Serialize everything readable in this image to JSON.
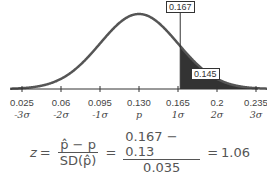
{
  "chart_data": {
    "type": "area",
    "title": "",
    "mean": 0.13,
    "sd": 0.035,
    "x_ticks": [
      0.025,
      0.06,
      0.095,
      0.13,
      0.165,
      0.2,
      0.235
    ],
    "x_tick_labels": [
      "0.025",
      "0.06",
      "0.095",
      "0.130",
      "0.165",
      "0.2",
      "0.235"
    ],
    "sigma_labels": [
      "-3σ",
      "-2σ",
      "-1σ",
      "p",
      "1σ",
      "2σ",
      "3σ"
    ],
    "observed_value": 0.167,
    "shaded_region": {
      "from": 0.167,
      "to": "inf",
      "area": 0.145
    },
    "annotations": [
      "0.167",
      "0.145"
    ],
    "xlabel": "",
    "ylabel": "",
    "grid": false
  },
  "labels": {
    "observed": "0.167",
    "tail_area": "0.145"
  },
  "formula": {
    "lhs": "z",
    "eq1": "=",
    "frac1_num": "p̂ − p",
    "frac1_den": "SD(p̂)",
    "eq2": "=",
    "frac2_num": "0.167 − 0.13",
    "frac2_den": "0.035",
    "eq3": "=",
    "result": "1.06"
  },
  "colors": {
    "curve": "#555555",
    "shade": "#333333",
    "axis": "#333333"
  }
}
